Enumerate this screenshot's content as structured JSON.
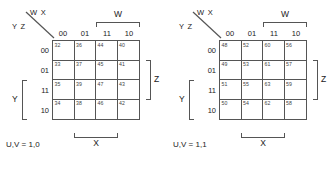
{
  "figure": {
    "kind": "karnaugh-map-pair",
    "maps": [
      {
        "caption": "U,V = 1,0",
        "corner_top_label": "W X",
        "corner_bottom_label": "Y Z",
        "column_headers": [
          "00",
          "01",
          "11",
          "10"
        ],
        "row_headers": [
          "00",
          "01",
          "11",
          "10"
        ],
        "group_labels": {
          "top": "W",
          "bottom": "X",
          "right": "Z",
          "left": "Y"
        },
        "cells": [
          [
            "32",
            "36",
            "44",
            "40"
          ],
          [
            "33",
            "37",
            "45",
            "41"
          ],
          [
            "35",
            "39",
            "47",
            "43"
          ],
          [
            "34",
            "38",
            "46",
            "42"
          ]
        ]
      },
      {
        "caption": "U,V = 1,1",
        "corner_top_label": "W X",
        "corner_bottom_label": "Y Z",
        "column_headers": [
          "00",
          "01",
          "11",
          "10"
        ],
        "row_headers": [
          "00",
          "01",
          "11",
          "10"
        ],
        "group_labels": {
          "top": "W",
          "bottom": "X",
          "right": "Z",
          "left": "Y"
        },
        "cells": [
          [
            "48",
            "52",
            "60",
            "56"
          ],
          [
            "49",
            "53",
            "61",
            "57"
          ],
          [
            "51",
            "55",
            "63",
            "59"
          ],
          [
            "50",
            "54",
            "62",
            "58"
          ]
        ]
      }
    ],
    "colors": {
      "background": "#ffffff",
      "grid_line": "#555555",
      "text": "#1a1a1a",
      "cell_number": "#444444"
    }
  }
}
